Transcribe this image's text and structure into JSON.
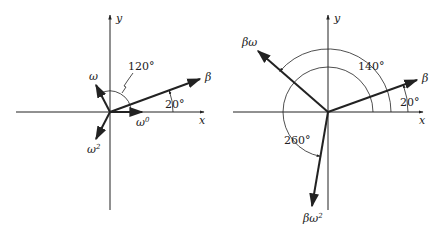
{
  "left_diagram": {
    "axis_labels": {
      "x": "x",
      "y": "y"
    },
    "vectors": [
      {
        "name": "beta",
        "label": "β",
        "angle_deg": 20
      },
      {
        "name": "omega",
        "label": "ω",
        "angle_deg": 120
      },
      {
        "name": "omega-squared",
        "label": "ω",
        "superscript": "2",
        "angle_deg": 240
      },
      {
        "name": "omega-zero",
        "label": "ω",
        "superscript": "0",
        "angle_deg": 0
      }
    ],
    "angle_labels": {
      "a120": "120°",
      "a20": "20°"
    }
  },
  "right_diagram": {
    "axis_labels": {
      "x": "x",
      "y": "y"
    },
    "vectors": [
      {
        "name": "beta",
        "label": "β",
        "angle_deg": 20
      },
      {
        "name": "beta-omega",
        "label": "βω",
        "angle_deg": 140
      },
      {
        "name": "beta-omega-squared",
        "label": "βω",
        "superscript": "2",
        "angle_deg": 260
      }
    ],
    "angle_labels": {
      "a140": "140°",
      "a260": "260°",
      "a20": "20°"
    }
  },
  "colors": {
    "ink": "#222222",
    "background": "#ffffff"
  }
}
